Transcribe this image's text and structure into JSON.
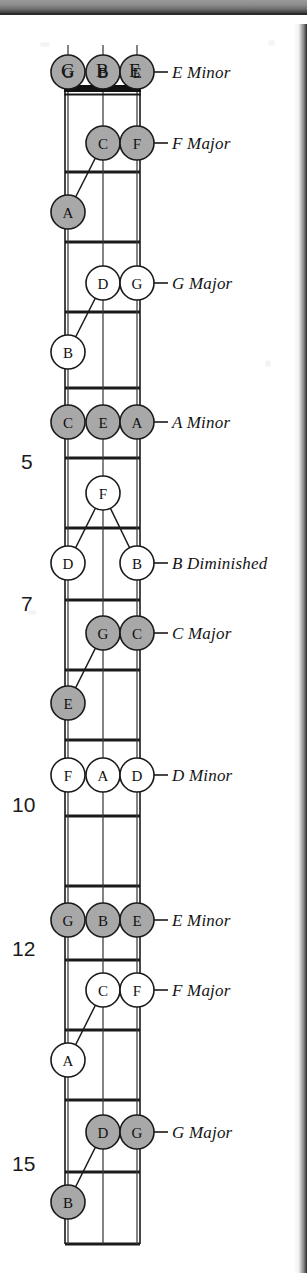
{
  "figure": {
    "kind": "guitar-fretboard-diagram",
    "instrument_strings": [
      "G",
      "B",
      "E"
    ],
    "open_string_labels": [
      "G",
      "B",
      "E"
    ],
    "fret_number_labels": [
      "5",
      "7",
      "10",
      "12",
      "15"
    ],
    "colors": {
      "filled_note": "#a8a8a8",
      "open_note": "#ffffff",
      "line": "#1a1a1a",
      "nut": "#111111",
      "text": "#121212"
    }
  },
  "chords": [
    {
      "name": "E Minor",
      "quality": "minor",
      "shaded": true,
      "notes": [
        "G",
        "B",
        "E"
      ]
    },
    {
      "name": "F Major",
      "quality": "major",
      "shaded": true,
      "notes": [
        "A",
        "C",
        "F"
      ]
    },
    {
      "name": "G Major",
      "quality": "major",
      "shaded": false,
      "notes": [
        "B",
        "D",
        "G"
      ]
    },
    {
      "name": "A Minor",
      "quality": "minor",
      "shaded": true,
      "notes": [
        "C",
        "E",
        "A"
      ]
    },
    {
      "name": "B Diminished",
      "quality": "diminished",
      "shaded": false,
      "notes": [
        "D",
        "F",
        "B"
      ]
    },
    {
      "name": "C Major",
      "quality": "major",
      "shaded": true,
      "notes": [
        "E",
        "G",
        "C"
      ]
    },
    {
      "name": "D Minor",
      "quality": "minor",
      "shaded": false,
      "notes": [
        "F",
        "A",
        "D"
      ]
    },
    {
      "name": "E Minor",
      "quality": "minor",
      "shaded": true,
      "notes": [
        "G",
        "B",
        "E"
      ]
    },
    {
      "name": "F Major",
      "quality": "major",
      "shaded": false,
      "notes": [
        "A",
        "C",
        "F"
      ]
    },
    {
      "name": "G Major",
      "quality": "major",
      "shaded": true,
      "notes": [
        "B",
        "D",
        "G"
      ]
    }
  ],
  "labels": [
    {
      "text": "E Minor",
      "x": 172,
      "y": 63,
      "leader_from": 140,
      "leader_to": 168,
      "leader_y": 72
    },
    {
      "text": "F Major",
      "x": 172,
      "y": 134,
      "leader_from": 152,
      "leader_to": 168,
      "leader_y": 143
    },
    {
      "text": "G Major",
      "x": 172,
      "y": 274,
      "leader_from": 152,
      "leader_to": 168,
      "leader_y": 283
    },
    {
      "text": "A Minor",
      "x": 172,
      "y": 413,
      "leader_from": 152,
      "leader_to": 168,
      "leader_y": 422
    },
    {
      "text": "B Diminished",
      "x": 172,
      "y": 554,
      "leader_from": 152,
      "leader_to": 168,
      "leader_y": 563
    },
    {
      "text": "C Major",
      "x": 172,
      "y": 624,
      "leader_from": 152,
      "leader_to": 168,
      "leader_y": 633
    },
    {
      "text": "D Minor",
      "x": 172,
      "y": 766,
      "leader_from": 152,
      "leader_to": 168,
      "leader_y": 775
    },
    {
      "text": "E Minor",
      "x": 172,
      "y": 911,
      "leader_from": 152,
      "leader_to": 168,
      "leader_y": 920
    },
    {
      "text": "F Major",
      "x": 172,
      "y": 981,
      "leader_from": 152,
      "leader_to": 168,
      "leader_y": 990
    },
    {
      "text": "G Major",
      "x": 172,
      "y": 1123,
      "leader_from": 152,
      "leader_to": 168,
      "leader_y": 1132
    }
  ],
  "string_headers": [
    {
      "text": "G",
      "x": 61,
      "y": 60
    },
    {
      "text": "B",
      "x": 96,
      "y": 60
    },
    {
      "text": "E",
      "x": 129,
      "y": 60
    }
  ],
  "fret_numbers": [
    {
      "text": "5",
      "x": 21,
      "y": 450
    },
    {
      "text": "7",
      "x": 21,
      "y": 592
    },
    {
      "text": "10",
      "x": 12,
      "y": 793
    },
    {
      "text": "12",
      "x": 12,
      "y": 937
    },
    {
      "text": "15",
      "x": 12,
      "y": 1152
    }
  ],
  "chart_data": {
    "type": "diagram",
    "strings": {
      "names": [
        "G",
        "B",
        "E"
      ],
      "x": [
        68,
        103,
        137
      ]
    },
    "nut_y": 90,
    "fret_lines_y": [
      92,
      172,
      242,
      312,
      388,
      458,
      528,
      600,
      670,
      740,
      816,
      886,
      960,
      1030,
      1100,
      1172,
      1244
    ],
    "notes": [
      {
        "chord": 0,
        "label": "G",
        "string": 0,
        "x": 68,
        "y": 72,
        "filled": true,
        "open": true
      },
      {
        "chord": 0,
        "label": "B",
        "string": 1,
        "x": 103,
        "y": 72,
        "filled": true,
        "open": true
      },
      {
        "chord": 0,
        "label": "E",
        "string": 2,
        "x": 137,
        "y": 72,
        "filled": true,
        "open": true
      },
      {
        "chord": 1,
        "label": "C",
        "string": 1,
        "x": 103,
        "y": 143,
        "filled": true
      },
      {
        "chord": 1,
        "label": "F",
        "string": 2,
        "x": 137,
        "y": 143,
        "filled": true
      },
      {
        "chord": 1,
        "label": "A",
        "string": 0,
        "x": 68,
        "y": 212,
        "filled": true
      },
      {
        "chord": 2,
        "label": "D",
        "string": 1,
        "x": 103,
        "y": 283,
        "filled": false
      },
      {
        "chord": 2,
        "label": "G",
        "string": 2,
        "x": 137,
        "y": 283,
        "filled": false
      },
      {
        "chord": 2,
        "label": "B",
        "string": 0,
        "x": 68,
        "y": 352,
        "filled": false
      },
      {
        "chord": 3,
        "label": "C",
        "string": 0,
        "x": 68,
        "y": 422,
        "filled": true
      },
      {
        "chord": 3,
        "label": "E",
        "string": 1,
        "x": 103,
        "y": 422,
        "filled": true
      },
      {
        "chord": 3,
        "label": "A",
        "string": 2,
        "x": 137,
        "y": 422,
        "filled": true
      },
      {
        "chord": 4,
        "label": "F",
        "string": 1,
        "x": 103,
        "y": 493,
        "filled": false
      },
      {
        "chord": 4,
        "label": "D",
        "string": 0,
        "x": 68,
        "y": 563,
        "filled": false
      },
      {
        "chord": 4,
        "label": "B",
        "string": 2,
        "x": 137,
        "y": 563,
        "filled": false
      },
      {
        "chord": 5,
        "label": "G",
        "string": 1,
        "x": 103,
        "y": 633,
        "filled": true
      },
      {
        "chord": 5,
        "label": "C",
        "string": 2,
        "x": 137,
        "y": 633,
        "filled": true
      },
      {
        "chord": 5,
        "label": "E",
        "string": 0,
        "x": 68,
        "y": 703,
        "filled": true
      },
      {
        "chord": 6,
        "label": "F",
        "string": 0,
        "x": 68,
        "y": 775,
        "filled": false
      },
      {
        "chord": 6,
        "label": "A",
        "string": 1,
        "x": 103,
        "y": 775,
        "filled": false
      },
      {
        "chord": 6,
        "label": "D",
        "string": 2,
        "x": 137,
        "y": 775,
        "filled": false
      },
      {
        "chord": 7,
        "label": "G",
        "string": 0,
        "x": 68,
        "y": 920,
        "filled": true
      },
      {
        "chord": 7,
        "label": "B",
        "string": 1,
        "x": 103,
        "y": 920,
        "filled": true
      },
      {
        "chord": 7,
        "label": "E",
        "string": 2,
        "x": 137,
        "y": 920,
        "filled": true
      },
      {
        "chord": 8,
        "label": "C",
        "string": 1,
        "x": 103,
        "y": 990,
        "filled": false
      },
      {
        "chord": 8,
        "label": "F",
        "string": 2,
        "x": 137,
        "y": 990,
        "filled": false
      },
      {
        "chord": 8,
        "label": "A",
        "string": 0,
        "x": 68,
        "y": 1060,
        "filled": false
      },
      {
        "chord": 9,
        "label": "D",
        "string": 1,
        "x": 103,
        "y": 1132,
        "filled": true
      },
      {
        "chord": 9,
        "label": "G",
        "string": 2,
        "x": 137,
        "y": 1132,
        "filled": true
      },
      {
        "chord": 9,
        "label": "B",
        "string": 0,
        "x": 68,
        "y": 1202,
        "filled": true
      }
    ],
    "connectors": [
      {
        "x1": 103,
        "y1": 143,
        "x2": 68,
        "y2": 212
      },
      {
        "x1": 103,
        "y1": 283,
        "x2": 68,
        "y2": 352
      },
      {
        "x1": 103,
        "y1": 493,
        "x2": 68,
        "y2": 563
      },
      {
        "x1": 103,
        "y1": 493,
        "x2": 137,
        "y2": 563
      },
      {
        "x1": 103,
        "y1": 633,
        "x2": 68,
        "y2": 703
      },
      {
        "x1": 103,
        "y1": 990,
        "x2": 68,
        "y2": 1060
      },
      {
        "x1": 103,
        "y1": 1132,
        "x2": 68,
        "y2": 1202
      }
    ]
  }
}
